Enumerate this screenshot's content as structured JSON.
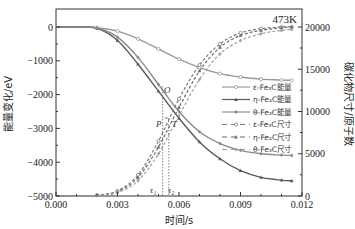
{
  "chart_data": {
    "type": "line",
    "title": "473K",
    "xlabel": "时间/s",
    "ylabel": "能量变化/eV",
    "y2label": "碳化物尺寸/原子数",
    "xlim": [
      0,
      0.012
    ],
    "ylim": [
      -5000,
      500
    ],
    "y2lim": [
      0,
      22000
    ],
    "xticks": [
      "0.000",
      "0.003",
      "0.006",
      "0.009",
      "0.012"
    ],
    "yticks": [
      "0",
      "-1000",
      "-2000",
      "-3000",
      "-4000",
      "-5000"
    ],
    "y2ticks": [
      "20000",
      "15000",
      "10000",
      "5000",
      "0"
    ],
    "grid": false,
    "legend_position": "center-right",
    "annotations": [
      "O",
      "P",
      "T",
      "τ1",
      "τ2"
    ],
    "tau1": 0.0052,
    "tau2": 0.0055,
    "x": [
      0.0,
      0.001,
      0.002,
      0.003,
      0.004,
      0.005,
      0.006,
      0.007,
      0.008,
      0.009,
      0.01,
      0.011,
      0.0115
    ],
    "series": [
      {
        "name": "ε-Fe3C能量",
        "axis": "left",
        "style": "solid-circle",
        "color": "#9a9a9a",
        "values": [
          0,
          0,
          -20,
          -120,
          -350,
          -650,
          -950,
          -1200,
          -1380,
          -1480,
          -1540,
          -1570,
          -1580
        ]
      },
      {
        "name": "η-Fe2C能量",
        "axis": "left",
        "style": "solid-triangle",
        "color": "#5a5a5a",
        "values": [
          0,
          0,
          -40,
          -400,
          -1100,
          -1900,
          -2700,
          -3400,
          -3900,
          -4250,
          -4450,
          -4530,
          -4550
        ]
      },
      {
        "name": "θ-Fe3C能量",
        "axis": "left",
        "style": "solid-diamond",
        "color": "#8a8a8a",
        "values": [
          0,
          0,
          -30,
          -300,
          -900,
          -1700,
          -2500,
          -3100,
          -3450,
          -3650,
          -3750,
          -3790,
          -3800
        ]
      },
      {
        "name": "ε-Fe3C尺寸",
        "axis": "right",
        "style": "dashed-circle",
        "color": "#7a7a7a",
        "values": [
          0,
          0,
          100,
          600,
          2500,
          6500,
          11500,
          15500,
          18000,
          19300,
          19800,
          20000,
          20000
        ]
      },
      {
        "name": "η-Fe2C尺寸",
        "axis": "right",
        "style": "dashed-triangle",
        "color": "#6a6a6a",
        "values": [
          0,
          0,
          80,
          500,
          2200,
          5800,
          10500,
          14800,
          17600,
          19000,
          19600,
          19900,
          20000
        ]
      },
      {
        "name": "θ-Fe3C尺寸",
        "axis": "right",
        "style": "dashed-diamond",
        "color": "#a0a0a0",
        "values": [
          0,
          0,
          60,
          400,
          1800,
          5000,
          9500,
          13800,
          16800,
          18400,
          19200,
          19600,
          19700
        ]
      }
    ]
  },
  "legend": {
    "items": [
      {
        "label": "ε-Fe₃C能量"
      },
      {
        "label": "η-Fe₂C能量"
      },
      {
        "label": "θ-Fe₃C能量"
      },
      {
        "label": "ε-Fe₃C尺寸"
      },
      {
        "label": "η-Fe₂C尺寸"
      },
      {
        "label": "θ-Fe₃C尺寸"
      }
    ]
  },
  "labels": {
    "title": "473K",
    "xlabel": "时间/s",
    "ylabel": "能量变化/eV",
    "y2label": "碳化物尺寸/原子数",
    "O": "O",
    "P": "P",
    "T": "T",
    "tau1": "τ₁",
    "tau2": "τ₂"
  }
}
